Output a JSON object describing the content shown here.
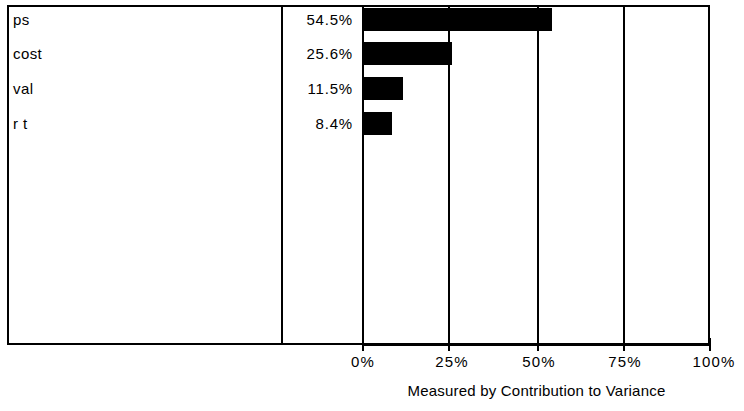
{
  "chart_data": {
    "type": "bar",
    "orientation": "horizontal",
    "title": "",
    "subtitle": "",
    "xlabel": "Measured by Contribution to Variance",
    "ylabel": "",
    "categories": [
      "ps",
      "cost",
      "val",
      "r t"
    ],
    "values": [
      54.5,
      25.6,
      11.5,
      8.4
    ],
    "value_labels": [
      "54.5%",
      "25.6%",
      "11.5%",
      "8.4%"
    ],
    "xlim": [
      0,
      100
    ],
    "xticks": [
      0,
      25,
      50,
      75,
      100
    ],
    "xtick_labels": [
      "0%",
      "25%",
      "50%",
      "75%",
      "100%"
    ],
    "grid": true,
    "gridlines": "vertical",
    "legend": "none",
    "series": [
      {
        "name": "Contribution to Variance",
        "values": [
          54.5,
          25.6,
          11.5,
          8.4
        ],
        "color": "#000000"
      }
    ],
    "colors": {
      "bar": "#000000",
      "axis": "#000000",
      "background": "#ffffff",
      "text": "#000000"
    }
  },
  "axis": {
    "caption": "Measured by Contribution to Variance",
    "ticks": [
      {
        "label": "0%",
        "value": 0
      },
      {
        "label": "25%",
        "value": 25
      },
      {
        "label": "50%",
        "value": 50
      },
      {
        "label": "75%",
        "value": 75
      },
      {
        "label": "100%",
        "value": 100
      }
    ]
  },
  "rows": [
    {
      "label": "ps",
      "percent": "54.5%",
      "value": 54.5
    },
    {
      "label": "cost",
      "percent": "25.6%",
      "value": 25.6
    },
    {
      "label": "val",
      "percent": "11.5%",
      "value": 11.5
    },
    {
      "label": "r t",
      "percent": "8.4%",
      "value": 8.4
    }
  ]
}
